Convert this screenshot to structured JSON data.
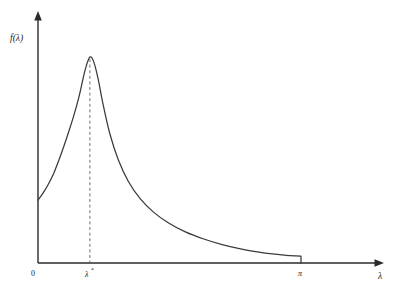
{
  "figure": {
    "title": "",
    "background_color": "#ffffff",
    "curve_color": "#3a3a3a",
    "axis_color": "#2b2b2b",
    "guide_color": "#6e6e6e"
  },
  "labels": {
    "y_axis": "f(λ)",
    "x_axis": "λ",
    "origin": "0",
    "peak_tick": "λ",
    "peak_tick_superscript": "*",
    "right_tick": "π"
  },
  "chart_data": {
    "type": "line",
    "title": "",
    "xlabel": "λ",
    "ylabel": "f(λ)",
    "xlim": [
      0,
      3.1416
    ],
    "ylim": [
      0,
      1.0
    ],
    "grid": false,
    "legend": null,
    "annotations": [
      {
        "text": "λ*",
        "kind": "x-tick",
        "x": 0.62,
        "note": "peak location, dashed vertical guide from peak to axis"
      },
      {
        "text": "π",
        "kind": "x-tick",
        "x": 3.1416,
        "note": "right endpoint, curve drops to axis"
      },
      {
        "text": "0",
        "kind": "origin",
        "x": 0.0
      }
    ],
    "x_tick_values": [
      0,
      0.62,
      3.1416
    ],
    "x_tick_labels": [
      "0",
      "λ*",
      "π"
    ],
    "y_tick_values": [],
    "y_tick_labels": [],
    "series": [
      {
        "name": "spectral density",
        "x": [
          0.0,
          0.06,
          0.12,
          0.19,
          0.25,
          0.31,
          0.37,
          0.43,
          0.49,
          0.53,
          0.56,
          0.59,
          0.62,
          0.65,
          0.68,
          0.72,
          0.78,
          0.86,
          0.96,
          1.08,
          1.22,
          1.38,
          1.56,
          1.76,
          1.98,
          2.2,
          2.42,
          2.62,
          2.8,
          2.96,
          3.08,
          3.1416,
          3.1416
        ],
        "y": [
          0.293,
          0.326,
          0.365,
          0.42,
          0.48,
          0.545,
          0.615,
          0.69,
          0.775,
          0.845,
          0.895,
          0.935,
          0.96,
          0.952,
          0.92,
          0.855,
          0.735,
          0.6,
          0.48,
          0.38,
          0.3,
          0.237,
          0.186,
          0.145,
          0.112,
          0.086,
          0.066,
          0.052,
          0.042,
          0.036,
          0.033,
          0.032,
          0.0
        ]
      }
    ]
  },
  "geometry": {
    "note": "pixel anchors used by the renderer; mirrors what is drawn in the image",
    "x_axis_y": 263,
    "y_axis_x": 38,
    "x_axis_end": 383,
    "y_axis_top": 13,
    "peak_x": 120,
    "peak_y": 57,
    "pi_x": 301,
    "curve_start_y": 190
  }
}
